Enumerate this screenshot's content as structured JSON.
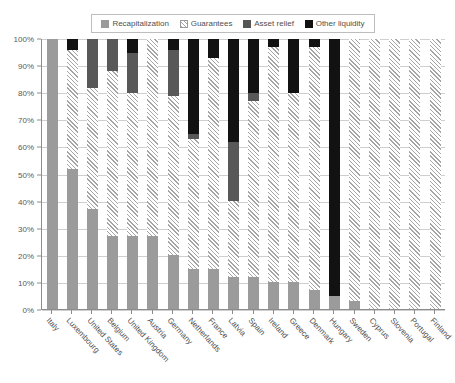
{
  "chart_data": {
    "type": "bar",
    "stacked": true,
    "normalized": true,
    "title": "",
    "subtitle": "",
    "xlabel": "",
    "ylabel": "",
    "ylim": [
      0,
      100
    ],
    "grid": true,
    "legend_position": "top",
    "ytick_labels": [
      "0%",
      "10%",
      "20%",
      "30%",
      "40%",
      "50%",
      "60%",
      "70%",
      "80%",
      "90%",
      "100%"
    ],
    "ytick_values": [
      0,
      10,
      20,
      30,
      40,
      50,
      60,
      70,
      80,
      90,
      100
    ],
    "legend": [
      {
        "name": "Recapitalization",
        "pattern": "solid-gray",
        "color": "#9b9b9b"
      },
      {
        "name": "Guarantees",
        "pattern": "diagonal-hatch",
        "color": "#a5a5a5"
      },
      {
        "name": "Asset relief",
        "pattern": "solid-dark-gray",
        "color": "#585858"
      },
      {
        "name": "Other liquidity",
        "pattern": "solid-black",
        "color": "#121212"
      }
    ],
    "categories": [
      "Italy",
      "Luxembourg",
      "United States",
      "Belgium",
      "United Kingdom",
      "Austria",
      "Germany",
      "Netherlands",
      "France",
      "Latvia",
      "Spain",
      "Ireland",
      "Greece",
      "Denmark",
      "Hungary",
      "Sweden",
      "Cyprus",
      "Slovenia",
      "Portugal",
      "Finland"
    ],
    "series": [
      {
        "name": "Recapitalization",
        "values": [
          100,
          52,
          37,
          27,
          27,
          27,
          20,
          15,
          15,
          12,
          12,
          10,
          10,
          7,
          5,
          3,
          0,
          0,
          0,
          0
        ]
      },
      {
        "name": "Guarantees",
        "values": [
          0,
          44,
          45,
          61,
          53,
          73,
          59,
          48,
          78,
          28,
          65,
          87,
          70,
          90,
          0,
          97,
          100,
          100,
          100,
          100
        ]
      },
      {
        "name": "Asset relief",
        "values": [
          0,
          0,
          18,
          12,
          15,
          0,
          17,
          2,
          0,
          22,
          3,
          0,
          0,
          0,
          0,
          0,
          0,
          0,
          0,
          0
        ]
      },
      {
        "name": "Other liquidity",
        "values": [
          0,
          4,
          0,
          0,
          5,
          0,
          4,
          35,
          7,
          38,
          20,
          3,
          20,
          3,
          95,
          0,
          0,
          0,
          0,
          0
        ]
      }
    ]
  }
}
